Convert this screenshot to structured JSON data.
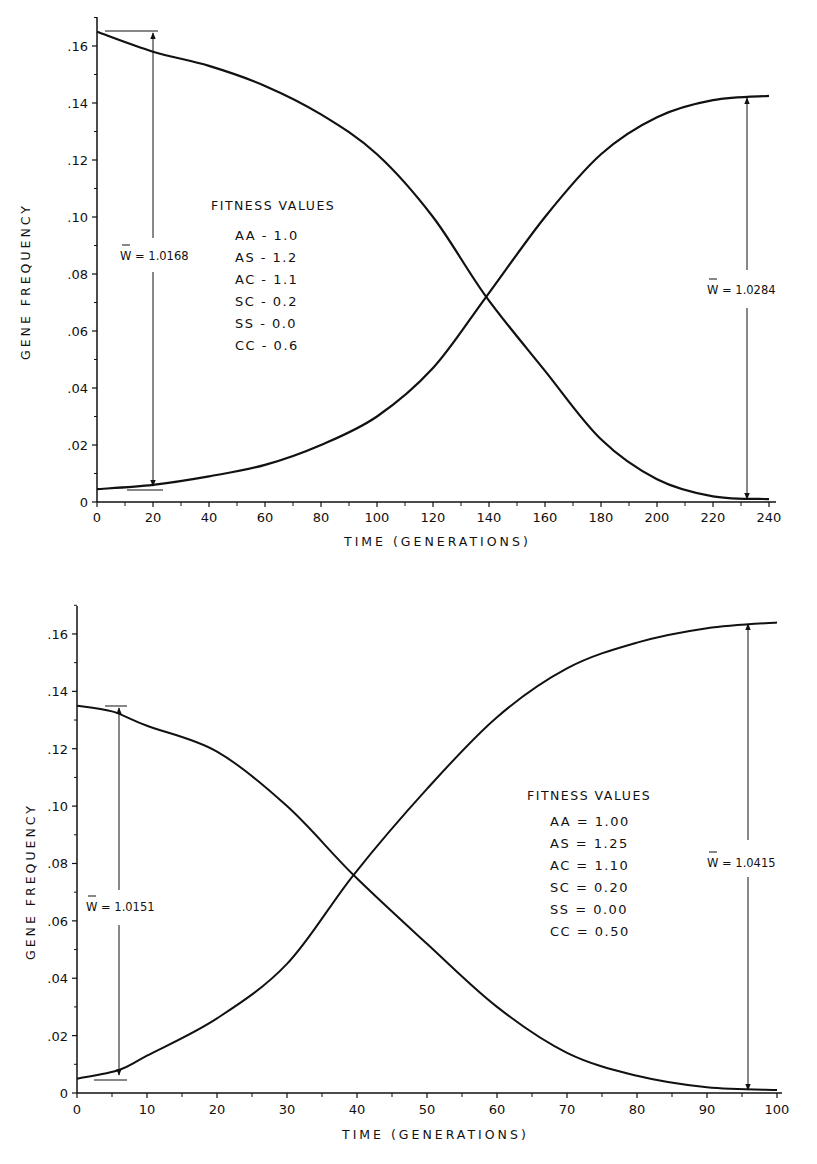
{
  "chart_data": [
    {
      "type": "line",
      "title": "",
      "xlabel": "TIME (GENERATIONS)",
      "ylabel": "GENE FREQUENCY",
      "xlim": [
        0,
        240
      ],
      "ylim": [
        0,
        0.17
      ],
      "xticks": [
        0,
        20,
        40,
        60,
        80,
        100,
        120,
        140,
        160,
        180,
        200,
        220,
        240
      ],
      "xtick_labels": [
        "0",
        "20",
        "40",
        "60",
        "80",
        "100",
        "120",
        "140",
        "160",
        "180",
        "200",
        "220",
        "240"
      ],
      "yticks": [
        0,
        0.02,
        0.04,
        0.06,
        0.08,
        0.1,
        0.12,
        0.14,
        0.16
      ],
      "ytick_labels": [
        "0",
        ".02",
        ".04",
        ".06",
        ".08",
        ".10",
        ".12",
        ".14",
        ".16"
      ],
      "grid": false,
      "series": [
        {
          "name": "decreasing allele",
          "x": [
            0,
            20,
            40,
            60,
            80,
            100,
            120,
            139,
            160,
            180,
            200,
            220,
            240
          ],
          "values": [
            0.165,
            0.158,
            0.153,
            0.146,
            0.136,
            0.122,
            0.1,
            0.072,
            0.046,
            0.022,
            0.008,
            0.002,
            0.001
          ]
        },
        {
          "name": "increasing allele",
          "x": [
            0,
            20,
            40,
            60,
            80,
            100,
            120,
            139,
            160,
            180,
            200,
            220,
            240
          ],
          "values": [
            0.0045,
            0.006,
            0.009,
            0.013,
            0.02,
            0.03,
            0.047,
            0.072,
            0.1,
            0.122,
            0.135,
            0.141,
            0.1425
          ]
        }
      ],
      "legend": {
        "title": "FITNESS VALUES",
        "items": [
          "AA - 1.0",
          "AS - 1.2",
          "AC - 1.1",
          "SC - 0.2",
          "SS - 0.0",
          "CC - 0.6"
        ]
      },
      "annotations": [
        {
          "text": "W̄ = 1.0168",
          "x": 20,
          "from": 0.005,
          "to": 0.165
        },
        {
          "text": "W̄ = 1.0284",
          "x": 230,
          "from": 0.001,
          "to": 0.1425
        }
      ]
    },
    {
      "type": "line",
      "title": "",
      "xlabel": "TIME (GENERATIONS)",
      "ylabel": "GENE FREQUENCY",
      "xlim": [
        0,
        100
      ],
      "ylim": [
        0,
        0.17
      ],
      "xticks": [
        0,
        10,
        20,
        30,
        40,
        50,
        60,
        70,
        80,
        90,
        100
      ],
      "xtick_labels": [
        "0",
        "10",
        "20",
        "30",
        "40",
        "50",
        "60",
        "70",
        "80",
        "90",
        "100"
      ],
      "yticks": [
        0,
        0.02,
        0.04,
        0.06,
        0.08,
        0.1,
        0.12,
        0.14,
        0.16
      ],
      "ytick_labels": [
        "0",
        ".02",
        ".04",
        ".06",
        ".08",
        ".10",
        ".12",
        ".14",
        ".16"
      ],
      "grid": false,
      "series": [
        {
          "name": "decreasing allele",
          "x": [
            0,
            5,
            10,
            20,
            30,
            39.5,
            50,
            60,
            70,
            80,
            90,
            100
          ],
          "values": [
            0.135,
            0.133,
            0.128,
            0.119,
            0.1,
            0.076,
            0.052,
            0.03,
            0.014,
            0.006,
            0.002,
            0.001
          ]
        },
        {
          "name": "increasing allele",
          "x": [
            0,
            6,
            10,
            20,
            30,
            39.5,
            50,
            60,
            70,
            80,
            90,
            100
          ],
          "values": [
            0.005,
            0.008,
            0.013,
            0.026,
            0.045,
            0.076,
            0.106,
            0.131,
            0.148,
            0.157,
            0.162,
            0.164
          ]
        }
      ],
      "legend": {
        "title": "FITNESS VALUES",
        "items": [
          "AA = 1.00",
          "AS = 1.25",
          "AC = 1.10",
          "SC = 0.20",
          "SS = 0.00",
          "CC = 0.50"
        ]
      },
      "annotations": [
        {
          "text": "W̄ = 1.0151",
          "x": 6,
          "from": 0.005,
          "to": 0.135
        },
        {
          "text": "W̄ = 1.0415",
          "x": 95,
          "from": 0.001,
          "to": 0.164
        }
      ]
    }
  ],
  "charts": {
    "top": {
      "xlabel": "TIME (GENERATIONS)",
      "ylabel": "GENE FREQUENCY",
      "legend_title": "FITNESS VALUES",
      "legend_items": [
        "AA - 1.0",
        "AS - 1.2",
        "AC - 1.1",
        "SC - 0.2",
        "SS - 0.0",
        "CC - 0.6"
      ],
      "wbar_left": "W = 1.0168",
      "wbar_right": "W = 1.0284"
    },
    "bottom": {
      "xlabel": "TIME (GENERATIONS)",
      "ylabel": "GENE FREQUENCY",
      "legend_title": "FITNESS VALUES",
      "legend_items": [
        "AA = 1.00",
        "AS = 1.25",
        "AC = 1.10",
        "SC = 0.20",
        "SS = 0.00",
        "CC = 0.50"
      ],
      "wbar_left": "W = 1.0151",
      "wbar_right": "W = 1.0415"
    }
  }
}
